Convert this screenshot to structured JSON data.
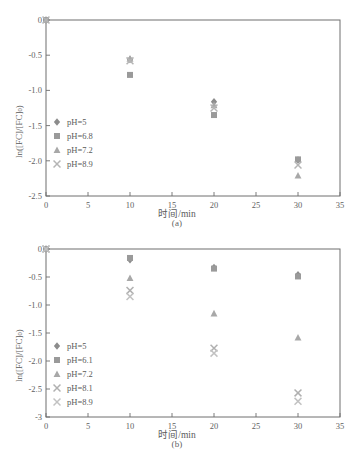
{
  "figure": {
    "panels": [
      {
        "id": "a",
        "caption": "(a)",
        "chart_data": {
          "type": "scatter",
          "title": "",
          "xlabel": "时间/min",
          "ylabel": "ln([FC]/[FC]0)",
          "ylabel_main": "ln([FC]/[FC]",
          "ylabel_sub": "0",
          "ylabel_tail": ")",
          "xlim": [
            0,
            35
          ],
          "ylim": [
            -2.5,
            0
          ],
          "xticks": [
            0,
            5,
            10,
            15,
            20,
            25,
            30,
            35
          ],
          "xticklabels": [
            "0",
            "5",
            "10",
            "15",
            "20",
            "25",
            "30",
            "35"
          ],
          "yticks": [
            0,
            -0.5,
            -1.0,
            -1.5,
            -2.0,
            -2.5
          ],
          "yticklabels": [
            "0",
            "-0.5",
            "-1.0",
            "-1.5",
            "-2.0",
            "-2.5"
          ],
          "grid": false,
          "legend_position": "center-left",
          "x": [
            0,
            10,
            20,
            30
          ],
          "series": [
            {
              "name": "pH=5",
              "marker": "diamond",
              "color": "#8c8c8c",
              "values": [
                0,
                -0.56,
                -1.16,
                -1.99
              ]
            },
            {
              "name": "pH=6.8",
              "marker": "square",
              "color": "#9a9a9a",
              "values": [
                0,
                -0.78,
                -1.35,
                -1.98
              ]
            },
            {
              "name": "pH=7.2",
              "marker": "triangle",
              "color": "#a8a8a8",
              "values": [
                0,
                -0.55,
                -1.21,
                -2.21
              ]
            },
            {
              "name": "pH=8.9",
              "marker": "cross",
              "color": "#b5b5b5",
              "values": [
                0,
                -0.58,
                -1.25,
                -2.06
              ]
            }
          ]
        }
      },
      {
        "id": "b",
        "caption": "(b)",
        "chart_data": {
          "type": "scatter",
          "title": "",
          "xlabel": "时间/min",
          "ylabel": "ln([FC]/[FC]0)",
          "ylabel_main": "ln([FC]/[FC]",
          "ylabel_sub": "0",
          "ylabel_tail": ")",
          "xlim": [
            0,
            35
          ],
          "ylim": [
            -3,
            0
          ],
          "xticks": [
            0,
            5,
            10,
            15,
            20,
            25,
            30,
            35
          ],
          "xticklabels": [
            "0",
            "5",
            "10",
            "15",
            "20",
            "25",
            "30",
            "35"
          ],
          "yticks": [
            0,
            -0.5,
            -1.0,
            -1.5,
            -2.0,
            -2.5,
            -3
          ],
          "yticklabels": [
            "0",
            "-0.5",
            "-1.0",
            "-1.5",
            "-2.0",
            "-2.5",
            "-3"
          ],
          "grid": false,
          "legend_position": "center-left",
          "x": [
            0,
            10,
            20,
            30
          ],
          "series": [
            {
              "name": "pH=5",
              "marker": "diamond",
              "color": "#8c8c8c",
              "values": [
                0,
                -0.19,
                -0.33,
                -0.46
              ]
            },
            {
              "name": "pH=6.1",
              "marker": "square",
              "color": "#9a9a9a",
              "values": [
                0,
                -0.16,
                -0.35,
                -0.49
              ]
            },
            {
              "name": "pH=7.2",
              "marker": "triangle",
              "color": "#a8a8a8",
              "values": [
                0,
                -0.52,
                -1.15,
                -1.58
              ]
            },
            {
              "name": "pH=8.1",
              "marker": "cross",
              "color": "#b0b0b0",
              "values": [
                0,
                -0.74,
                -1.77,
                -2.57
              ]
            },
            {
              "name": "pH=8.9",
              "marker": "cross",
              "color": "#c2c2c2",
              "values": [
                0,
                -0.85,
                -1.86,
                -2.72
              ]
            }
          ]
        }
      }
    ]
  }
}
